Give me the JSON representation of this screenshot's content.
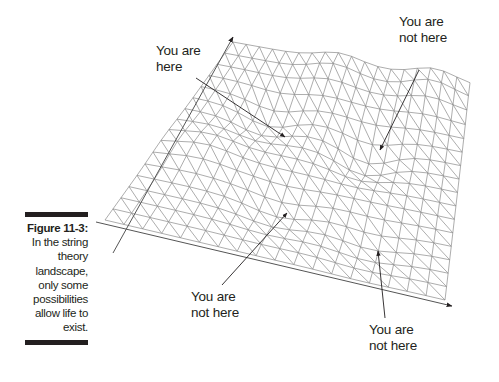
{
  "caption": {
    "figure_number": "Figure 11-3:",
    "lines": [
      "In the string",
      "theory",
      "landscape,",
      "only some",
      "possibilities",
      "allow life to",
      "exist."
    ]
  },
  "labels": {
    "here": [
      "You are",
      "here"
    ],
    "not_here_top_right": [
      "You are",
      "not here"
    ],
    "not_here_bottom_center": [
      "You are",
      "not here"
    ],
    "not_here_bottom_right": [
      "You are",
      "not here"
    ]
  },
  "colors": {
    "mesh": "#8a8a8a",
    "ink": "#231f20"
  }
}
